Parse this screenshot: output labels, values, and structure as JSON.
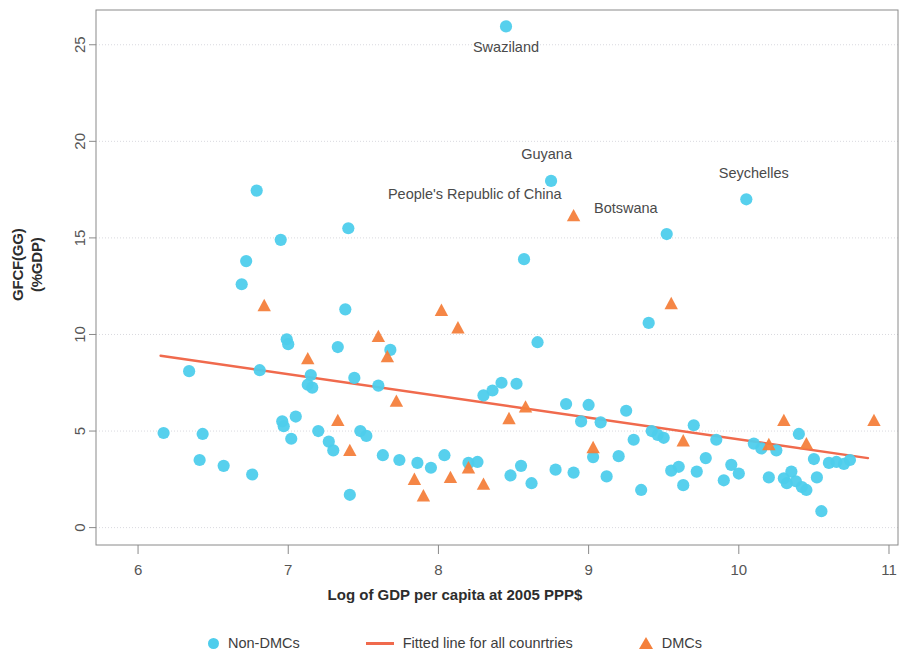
{
  "chart_data": {
    "type": "scatter",
    "title": "",
    "xlabel": "Log of GDP per capita at 2005 PPP$",
    "ylabel_line1": "GFCF(GG)",
    "ylabel_line2": "(%GDP)",
    "xlim": [
      5.72,
      11.06
    ],
    "ylim": [
      -0.9,
      26.8
    ],
    "xticks": [
      6,
      7,
      8,
      9,
      10,
      11
    ],
    "yticks": [
      0,
      5,
      10,
      15,
      20,
      25
    ],
    "grid": "horizontal",
    "legend_position": "bottom",
    "colors": {
      "non_dmc": "#4ECDEC",
      "dmc": "#F4803C",
      "fitted_line": "#F06A4D",
      "grid": "#d9d9df",
      "axis": "#8a8a8a",
      "text": "#4a4a4a"
    },
    "series": [
      {
        "name": "Non-DMCs",
        "marker": "circle",
        "color": "#4ECDEC",
        "points": [
          [
            6.17,
            4.9
          ],
          [
            6.34,
            8.1
          ],
          [
            6.41,
            3.5
          ],
          [
            6.43,
            4.85
          ],
          [
            6.57,
            3.2
          ],
          [
            6.69,
            12.6
          ],
          [
            6.72,
            13.8
          ],
          [
            6.76,
            2.75
          ],
          [
            6.79,
            17.45
          ],
          [
            6.81,
            8.15
          ],
          [
            6.95,
            14.9
          ],
          [
            6.96,
            5.5
          ],
          [
            6.97,
            5.25
          ],
          [
            6.99,
            9.75
          ],
          [
            7.0,
            9.5
          ],
          [
            7.02,
            4.6
          ],
          [
            7.05,
            5.75
          ],
          [
            7.13,
            7.4
          ],
          [
            7.15,
            7.9
          ],
          [
            7.16,
            7.25
          ],
          [
            7.2,
            5.0
          ],
          [
            7.27,
            4.45
          ],
          [
            7.3,
            4.0
          ],
          [
            7.33,
            9.35
          ],
          [
            7.38,
            11.3
          ],
          [
            7.4,
            15.5
          ],
          [
            7.41,
            1.7
          ],
          [
            7.44,
            7.75
          ],
          [
            7.48,
            5.0
          ],
          [
            7.52,
            4.75
          ],
          [
            7.6,
            7.35
          ],
          [
            7.63,
            3.75
          ],
          [
            7.68,
            9.2
          ],
          [
            7.74,
            3.5
          ],
          [
            7.86,
            3.35
          ],
          [
            7.95,
            3.1
          ],
          [
            8.04,
            3.75
          ],
          [
            8.2,
            3.35
          ],
          [
            8.26,
            3.4
          ],
          [
            8.3,
            6.85
          ],
          [
            8.36,
            7.1
          ],
          [
            8.42,
            7.5
          ],
          [
            8.45,
            25.95
          ],
          [
            8.48,
            2.7
          ],
          [
            8.52,
            7.45
          ],
          [
            8.55,
            3.2
          ],
          [
            8.57,
            13.9
          ],
          [
            8.62,
            2.3
          ],
          [
            8.66,
            9.6
          ],
          [
            8.75,
            17.95
          ],
          [
            8.78,
            3.0
          ],
          [
            8.85,
            6.4
          ],
          [
            8.9,
            2.85
          ],
          [
            8.95,
            5.5
          ],
          [
            9.0,
            6.35
          ],
          [
            9.03,
            3.65
          ],
          [
            9.08,
            5.45
          ],
          [
            9.12,
            2.65
          ],
          [
            9.2,
            3.7
          ],
          [
            9.25,
            6.05
          ],
          [
            9.3,
            4.55
          ],
          [
            9.35,
            1.95
          ],
          [
            9.4,
            10.6
          ],
          [
            9.42,
            5.0
          ],
          [
            9.46,
            4.8
          ],
          [
            9.5,
            4.65
          ],
          [
            9.52,
            15.2
          ],
          [
            9.55,
            2.95
          ],
          [
            9.6,
            3.15
          ],
          [
            9.63,
            2.2
          ],
          [
            9.7,
            5.3
          ],
          [
            9.72,
            2.9
          ],
          [
            9.78,
            3.6
          ],
          [
            9.85,
            4.55
          ],
          [
            9.9,
            2.45
          ],
          [
            9.95,
            3.25
          ],
          [
            10.0,
            2.8
          ],
          [
            10.05,
            17.0
          ],
          [
            10.1,
            4.35
          ],
          [
            10.15,
            4.1
          ],
          [
            10.2,
            2.6
          ],
          [
            10.25,
            4.0
          ],
          [
            10.3,
            2.55
          ],
          [
            10.32,
            2.3
          ],
          [
            10.35,
            2.9
          ],
          [
            10.38,
            2.4
          ],
          [
            10.4,
            4.85
          ],
          [
            10.42,
            2.1
          ],
          [
            10.45,
            1.95
          ],
          [
            10.5,
            3.55
          ],
          [
            10.52,
            2.6
          ],
          [
            10.55,
            0.85
          ],
          [
            10.6,
            3.35
          ],
          [
            10.65,
            3.4
          ],
          [
            10.7,
            3.3
          ],
          [
            10.74,
            3.5
          ]
        ]
      },
      {
        "name": "DMCs",
        "marker": "triangle",
        "color": "#F4803C",
        "points": [
          [
            6.84,
            11.45
          ],
          [
            7.13,
            8.7
          ],
          [
            7.33,
            5.5
          ],
          [
            7.41,
            3.95
          ],
          [
            7.6,
            9.85
          ],
          [
            7.66,
            8.8
          ],
          [
            7.72,
            6.5
          ],
          [
            7.84,
            2.45
          ],
          [
            7.9,
            1.6
          ],
          [
            8.02,
            11.2
          ],
          [
            8.08,
            2.55
          ],
          [
            8.13,
            10.3
          ],
          [
            8.2,
            3.05
          ],
          [
            8.3,
            2.2
          ],
          [
            8.47,
            5.6
          ],
          [
            8.58,
            6.2
          ],
          [
            8.9,
            16.1
          ],
          [
            9.03,
            4.1
          ],
          [
            9.55,
            11.55
          ],
          [
            9.63,
            4.45
          ],
          [
            10.2,
            4.25
          ],
          [
            10.3,
            5.5
          ],
          [
            10.45,
            4.3
          ],
          [
            10.9,
            5.5
          ]
        ]
      }
    ],
    "fitted_line": {
      "name": "Fitted line for all counrtries",
      "color": "#F06A4D",
      "x": [
        6.15,
        10.86
      ],
      "y": [
        8.9,
        3.6
      ]
    },
    "annotations": [
      {
        "label": "Swaziland",
        "x": 8.45,
        "y": 24.6,
        "anchor": "middle"
      },
      {
        "label": "Guyana",
        "x": 8.72,
        "y": 19.1,
        "anchor": "middle"
      },
      {
        "label": "People's Republic of China",
        "x": 8.82,
        "y": 17.0,
        "anchor": "end"
      },
      {
        "label": "Botswana",
        "x": 9.46,
        "y": 16.3,
        "anchor": "end"
      },
      {
        "label": "Seychelles",
        "x": 10.1,
        "y": 18.1,
        "anchor": "middle"
      }
    ]
  },
  "legend": {
    "non_dmcs": "Non-DMCs",
    "fitted": "Fitted line for all counrtries",
    "dmcs": "DMCs"
  }
}
